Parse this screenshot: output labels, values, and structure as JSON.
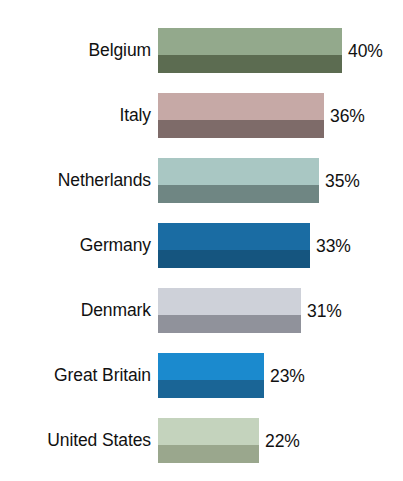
{
  "chart_data": {
    "type": "bar",
    "orientation": "horizontal",
    "title": "",
    "subtitle": "",
    "xlabel": "",
    "ylabel": "",
    "grid": false,
    "legend": "none",
    "axis_visible": false,
    "value_suffix": "%",
    "xlim": [
      0,
      40
    ],
    "categories": [
      "Belgium",
      "Italy",
      "Netherlands",
      "Germany",
      "Denmark",
      "Great Britain",
      "United States"
    ],
    "values": [
      40,
      36,
      35,
      33,
      31,
      23,
      22
    ],
    "value_labels": [
      "40%",
      "36%",
      "35%",
      "33%",
      "31%",
      "23%",
      "22%"
    ],
    "bar_colors_top": [
      "#93a98c",
      "#c6a9a6",
      "#a9c7c3",
      "#1a6ca3",
      "#ced1d9",
      "#1b8ace",
      "#c4d3bd"
    ],
    "bar_colors_bottom": [
      "#5c6c51",
      "#7e6b69",
      "#6f8683",
      "#15557f",
      "#90929b",
      "#1a6596",
      "#9aa78d"
    ]
  },
  "rows": [
    {
      "label": "Belgium",
      "value": 40,
      "value_label": "40%",
      "color_top": "#93a98c",
      "color_bottom": "#5c6c51",
      "top": 28,
      "width": 184
    },
    {
      "label": "Italy",
      "value": 36,
      "value_label": "36%",
      "color_top": "#c6a9a6",
      "color_bottom": "#7e6b69",
      "top": 93,
      "width": 166
    },
    {
      "label": "Netherlands",
      "value": 35,
      "value_label": "35%",
      "color_top": "#a9c7c3",
      "color_bottom": "#6f8683",
      "top": 158,
      "width": 161
    },
    {
      "label": "Germany",
      "value": 33,
      "value_label": "33%",
      "color_top": "#1a6ca3",
      "color_bottom": "#15557f",
      "top": 223,
      "width": 152
    },
    {
      "label": "Denmark",
      "value": 31,
      "value_label": "31%",
      "color_top": "#ced1d9",
      "color_bottom": "#90929b",
      "top": 288,
      "width": 143
    },
    {
      "label": "Great Britain",
      "value": 23,
      "value_label": "23%",
      "color_top": "#1b8ace",
      "color_bottom": "#1a6596",
      "top": 353,
      "width": 106
    },
    {
      "label": "United States",
      "value": 22,
      "value_label": "22%",
      "color_top": "#c4d3bd",
      "color_bottom": "#9aa78d",
      "top": 418,
      "width": 101
    }
  ]
}
